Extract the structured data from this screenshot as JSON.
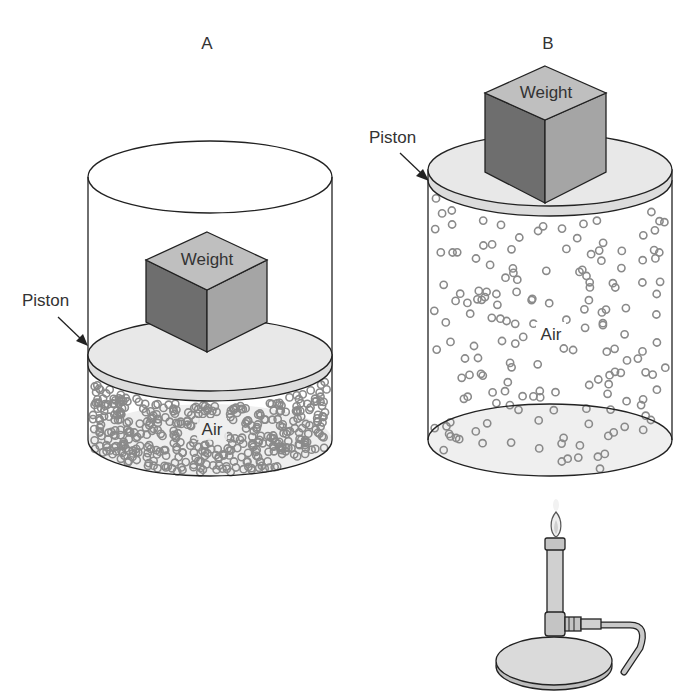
{
  "figure": {
    "colors": {
      "outline": "#222222",
      "piston_fill": "#e6e6e6",
      "cube_top": "#bdbdbd",
      "cube_left": "#6e6e6e",
      "cube_right": "#a3a3a3",
      "molecule_stroke": "#8a8a8a",
      "floor_fill": "#eeeeee",
      "burner_fill": "#d6d6d6"
    }
  },
  "panels": [
    {
      "id": "A",
      "label": "A",
      "piston_label": "Piston",
      "weight_label": "Weight",
      "gas_label": "Air",
      "state": "compressed",
      "heated": false
    },
    {
      "id": "B",
      "label": "B",
      "piston_label": "Piston",
      "weight_label": "Weight",
      "gas_label": "Air",
      "state": "expanded",
      "heated": true,
      "heat_source": "bunsen-burner"
    }
  ]
}
